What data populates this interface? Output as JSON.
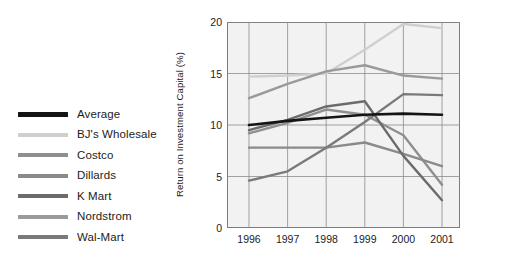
{
  "legend": {
    "items": [
      {
        "label": "Average",
        "color": "#141414"
      },
      {
        "label": "BJ's Wholesale",
        "color": "#cfcfcf"
      },
      {
        "label": "Costco",
        "color": "#8f8f8f"
      },
      {
        "label": "Dillards",
        "color": "#8a8a8a"
      },
      {
        "label": "K Mart",
        "color": "#6b6b6b"
      },
      {
        "label": "Nordstrom",
        "color": "#9a9a9a"
      },
      {
        "label": "Wal-Mart",
        "color": "#7a7a7a"
      }
    ]
  },
  "axes": {
    "y_title": "Return on Investment Capital (%)",
    "y_ticks": [
      "0",
      "5",
      "10",
      "15",
      "20"
    ],
    "x_ticks": [
      "1996",
      "1997",
      "1998",
      "1999",
      "2000",
      "2001"
    ]
  },
  "chart_data": {
    "type": "line",
    "title": "",
    "xlabel": "",
    "ylabel": "Return on Investment Capital (%)",
    "categories": [
      "1996",
      "1997",
      "1998",
      "1999",
      "2000",
      "2001"
    ],
    "xlim": [
      1996,
      2001
    ],
    "ylim": [
      0,
      20
    ],
    "yticks": [
      0,
      5,
      10,
      15,
      20
    ],
    "grid": true,
    "legend_position": "left-outside",
    "series": [
      {
        "name": "Average",
        "color": "#141414",
        "width": 2.6,
        "values": [
          10.0,
          10.4,
          10.7,
          11.0,
          11.1,
          11.0
        ]
      },
      {
        "name": "BJ's Wholesale",
        "color": "#cfcfcf",
        "width": 2.4,
        "values": [
          14.7,
          14.8,
          15.0,
          17.3,
          19.8,
          19.4
        ]
      },
      {
        "name": "Costco",
        "color": "#8f8f8f",
        "width": 2.4,
        "values": [
          9.2,
          10.2,
          11.5,
          11.0,
          9.0,
          4.2
        ]
      },
      {
        "name": "Dillards",
        "color": "#8a8a8a",
        "width": 2.4,
        "values": [
          7.8,
          7.8,
          7.8,
          8.3,
          7.2,
          6.0
        ]
      },
      {
        "name": "K Mart",
        "color": "#6b6b6b",
        "width": 2.4,
        "values": [
          9.5,
          10.5,
          11.8,
          12.3,
          7.0,
          2.7
        ]
      },
      {
        "name": "Nordstrom",
        "color": "#9a9a9a",
        "width": 2.4,
        "values": [
          12.6,
          14.0,
          15.2,
          15.8,
          14.8,
          14.5
        ]
      },
      {
        "name": "Wal-Mart",
        "color": "#7a7a7a",
        "width": 2.4,
        "values": [
          4.6,
          5.5,
          7.8,
          10.3,
          13.0,
          12.9
        ]
      }
    ]
  }
}
